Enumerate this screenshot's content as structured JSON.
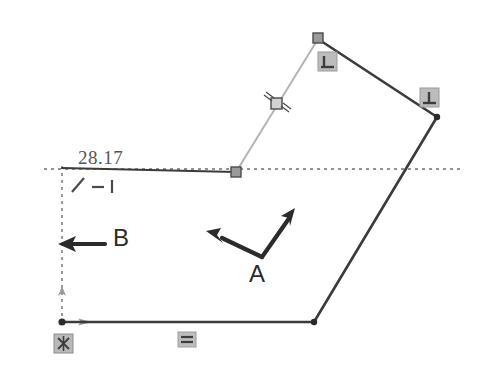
{
  "drawing": {
    "title": "Sketch constraint view",
    "background_color": "#ffffff",
    "line_color": "#3b3b3b",
    "highlight_line_color": "#b0b0b0",
    "dimension_color": "#555555",
    "constraint_icon_color": "#8a8a8a",
    "annotation_color": "#2b2b2b"
  },
  "dimension": {
    "value": "28.17",
    "label": "28.17"
  },
  "annotations": {
    "arrow_a_label": "A",
    "arrow_b_label": "B"
  },
  "constraint_glyphs": {
    "slash": "slash-constraint-icon",
    "dash": "dash-constraint-icon",
    "bar": "bar-constraint-icon"
  },
  "icons": {
    "perpendicular_top": "perpendicular-constraint-icon",
    "perpendicular_right": "perpendicular-constraint-icon",
    "midpoint": "midpoint-constraint-icon",
    "fixed": "fixed-anchor-constraint-icon",
    "horizontal": "horizontal-constraint-icon"
  },
  "geometry": {
    "vertices": [
      {
        "name": "origin-top-left",
        "x": 62,
        "y": 168
      },
      {
        "name": "mid-top",
        "x": 236,
        "y": 172
      },
      {
        "name": "apex",
        "x": 318,
        "y": 38
      },
      {
        "name": "right",
        "x": 437,
        "y": 116
      },
      {
        "name": "bottom-right",
        "x": 314,
        "y": 322
      },
      {
        "name": "bottom-left",
        "x": 62,
        "y": 322
      }
    ]
  }
}
